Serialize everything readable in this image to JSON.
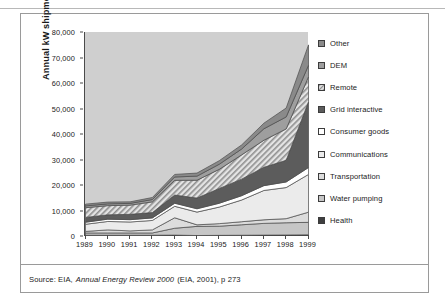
{
  "source_note": {
    "prefix": "Source: EIA,",
    "italic_title": "Annual Energy Review 2000",
    "suffix": "(EIA, 2001), p 273"
  },
  "legend": {
    "items": [
      {
        "label": "Other",
        "swatch": "solid-midgray",
        "color": "#8a8a8a"
      },
      {
        "label": "DEM",
        "swatch": "solid-gray",
        "color": "#9e9e9e"
      },
      {
        "label": "Remote",
        "swatch": "diagonal-hatch",
        "color": "#d8d8d8"
      },
      {
        "label": "Grid interactive",
        "swatch": "solid-darkgray",
        "color": "#5c5c5c"
      },
      {
        "label": "Consumer goods",
        "swatch": "solid-white",
        "color": "#ffffff"
      },
      {
        "label": "Communications",
        "swatch": "solid-verylight",
        "color": "#ebebeb"
      },
      {
        "label": "Transportation",
        "swatch": "solid-light",
        "color": "#dcdcdc"
      },
      {
        "label": "Water pumping",
        "swatch": "solid-lightgray",
        "color": "#c6c6c6"
      },
      {
        "label": "Health",
        "swatch": "solid-dark",
        "color": "#3f3f3f"
      }
    ]
  },
  "chart_data": {
    "type": "area",
    "stacked": true,
    "title": "",
    "xlabel": "",
    "ylabel": "Annual kW shipments",
    "x": [
      1989,
      1990,
      1991,
      1992,
      1993,
      1994,
      1995,
      1996,
      1997,
      1998,
      1999
    ],
    "categories": [
      "1989",
      "1990",
      "1991",
      "1992",
      "1993",
      "1994",
      "1995",
      "1996",
      "1997",
      "1998",
      "1999"
    ],
    "xtick_labels": [
      "1989",
      "1990",
      "1991",
      "1992",
      "1993",
      "1994",
      "1995",
      "1996",
      "1997",
      "1998",
      "1999"
    ],
    "ytick_labels": [
      "0",
      "10,000",
      "20,000",
      "30,000",
      "40,000",
      "50,000",
      "60,000",
      "70,000",
      "80,000"
    ],
    "ytick_values": [
      0,
      10000,
      20000,
      30000,
      40000,
      50000,
      60000,
      70000,
      80000
    ],
    "ylim": [
      0,
      80000
    ],
    "xlim": [
      1989,
      1999
    ],
    "grid": false,
    "legend_position": "right",
    "plot_background": "#cfcfcf",
    "series": [
      {
        "name": "Health",
        "fill": "#3f3f3f",
        "pattern": "solid",
        "values": [
          300,
          300,
          300,
          300,
          350,
          180,
          250,
          300,
          350,
          400,
          450
        ]
      },
      {
        "name": "Water pumping",
        "fill": "#c6c6c6",
        "pattern": "solid",
        "values": [
          900,
          900,
          900,
          900,
          2700,
          3600,
          3600,
          4100,
          4600,
          4800,
          4900
        ]
      },
      {
        "name": "Transportation",
        "fill": "#dcdcdc",
        "pattern": "solid",
        "values": [
          600,
          1200,
          800,
          1200,
          4100,
          600,
          1000,
          1200,
          1400,
          1600,
          4000
        ]
      },
      {
        "name": "Communications",
        "fill": "#ebebeb",
        "pattern": "solid",
        "values": [
          2800,
          3300,
          3500,
          3700,
          4500,
          5000,
          6500,
          8500,
          11500,
          12200,
          14800
        ]
      },
      {
        "name": "Consumer goods",
        "fill": "#ffffff",
        "pattern": "solid",
        "values": [
          800,
          900,
          900,
          1000,
          1200,
          1300,
          1500,
          1700,
          1900,
          2200,
          2700
        ]
      },
      {
        "name": "Grid interactive",
        "fill": "#5c5c5c",
        "pattern": "solid",
        "values": [
          1900,
          1700,
          2100,
          2100,
          3200,
          4200,
          5800,
          6500,
          7200,
          8500,
          25800
        ]
      },
      {
        "name": "Remote",
        "fill": "#d8d8d8",
        "pattern": "hatch",
        "values": [
          3800,
          3600,
          3600,
          4200,
          5800,
          7000,
          7500,
          9500,
          10600,
          12300,
          9800
        ]
      },
      {
        "name": "DEM",
        "fill": "#9e9e9e",
        "pattern": "solid",
        "values": [
          700,
          700,
          700,
          900,
          1300,
          1600,
          2000,
          2300,
          4500,
          4700,
          4500
        ]
      },
      {
        "name": "Other",
        "fill": "#8a8a8a",
        "pattern": "solid",
        "values": [
          700,
          700,
          600,
          800,
          1000,
          1200,
          1400,
          1600,
          2200,
          3500,
          8000
        ]
      }
    ],
    "totals": [
      12500,
      13300,
      13400,
      15100,
      24150,
      24680,
      29550,
      35700,
      44250,
      50200,
      74950
    ]
  }
}
